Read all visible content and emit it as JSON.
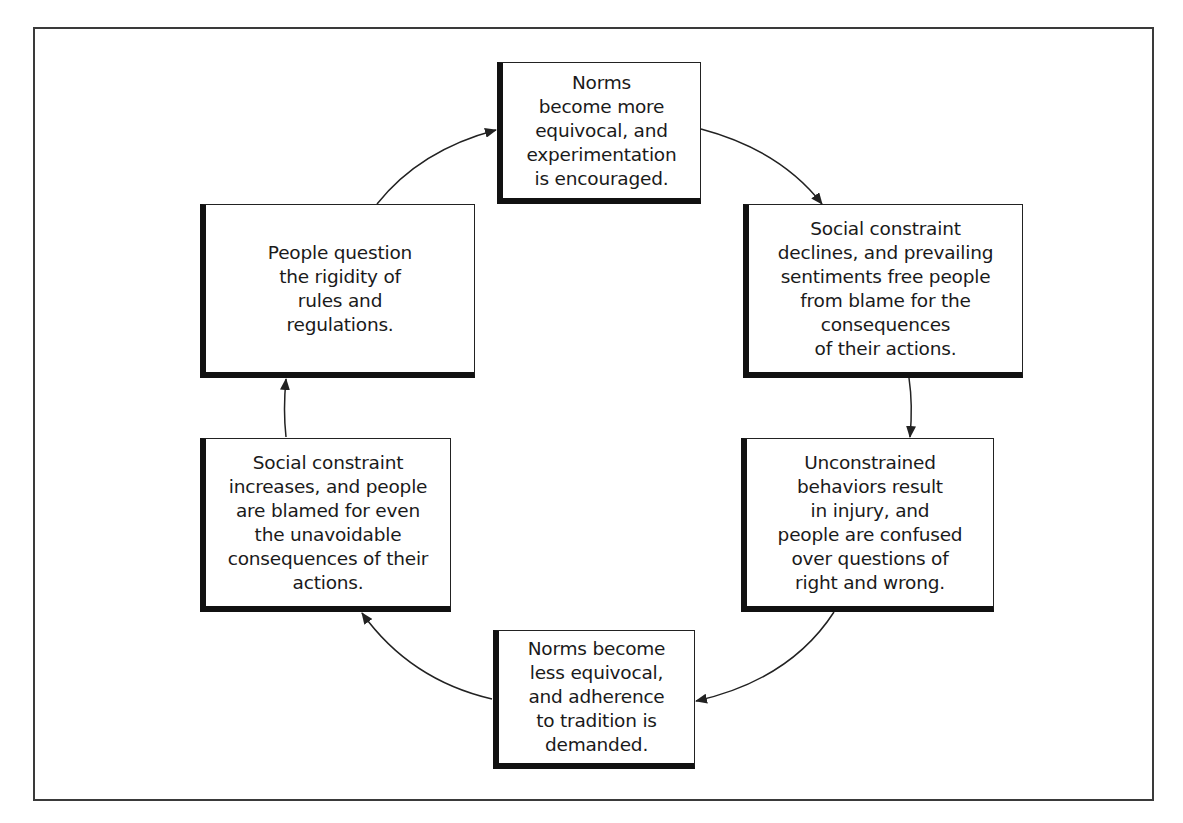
{
  "diagram": {
    "type": "cycle",
    "nodes": [
      {
        "id": "top",
        "text": "Norms\nbecome more\nequivocal, and\nexperimentation\nis encouraged."
      },
      {
        "id": "top-right",
        "text": "Social constraint\ndeclines, and prevailing\nsentiments free people\nfrom blame for the\nconsequences\nof their actions."
      },
      {
        "id": "bottom-right",
        "text": "Unconstrained\nbehaviors result\nin injury, and\npeople are confused\nover questions of\nright and wrong."
      },
      {
        "id": "bottom",
        "text": "Norms become\nless equivocal,\nand adherence\nto tradition is\ndemanded."
      },
      {
        "id": "bottom-left",
        "text": "Social constraint\nincreases, and people\nare blamed for even\nthe unavoidable\nconsequences of their\nactions."
      },
      {
        "id": "top-left",
        "text": "People question\nthe rigidity of\nrules and\nregulations."
      }
    ],
    "edges": [
      {
        "from": "top",
        "to": "top-right"
      },
      {
        "from": "top-right",
        "to": "bottom-right"
      },
      {
        "from": "bottom-right",
        "to": "bottom"
      },
      {
        "from": "bottom",
        "to": "bottom-left"
      },
      {
        "from": "bottom-left",
        "to": "top-left"
      },
      {
        "from": "top-left",
        "to": "top"
      }
    ],
    "colors": {
      "line": "#222222",
      "box_fill": "#ffffff",
      "background": "#ffffff"
    }
  }
}
